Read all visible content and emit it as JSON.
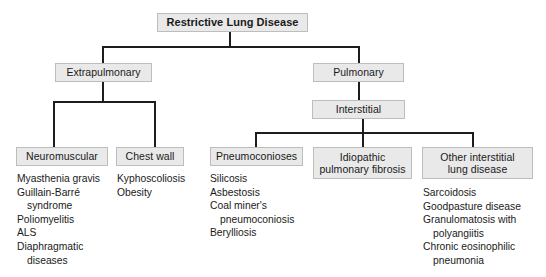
{
  "diagram": {
    "title": "Restrictive Lung Disease",
    "type": "hierarchy-flowchart",
    "nodes": {
      "root": "Restrictive Lung Disease",
      "extrapulmonary": "Extrapulmonary",
      "pulmonary": "Pulmonary",
      "interstitial": "Interstitial",
      "neuromuscular": "Neuromuscular",
      "chest_wall": "Chest wall",
      "pneumoconioses": "Pneumoconioses",
      "idiopathic_pulmonary_fibrosis_line1": "Idiopathic",
      "idiopathic_pulmonary_fibrosis_line2": "pulmonary fibrosis",
      "other_interstitial_line1": "Other interstitial",
      "other_interstitial_line2": "lung disease"
    },
    "lists": {
      "neuromuscular": {
        "items": [
          {
            "main": "Myasthenia gravis",
            "cont": ""
          },
          {
            "main": "Guillain-Barré",
            "cont": "syndrome"
          },
          {
            "main": "Poliomyelitis",
            "cont": ""
          },
          {
            "main": "ALS",
            "cont": ""
          },
          {
            "main": "Diaphragmatic",
            "cont": "diseases"
          }
        ]
      },
      "chest_wall": {
        "items": [
          {
            "main": "Kyphoscoliosis",
            "cont": ""
          },
          {
            "main": "Obesity",
            "cont": ""
          }
        ]
      },
      "pneumoconioses": {
        "items": [
          {
            "main": "Silicosis",
            "cont": ""
          },
          {
            "main": "Asbestosis",
            "cont": ""
          },
          {
            "main": "Coal miner's",
            "cont": "pneumoconiosis"
          },
          {
            "main": "Berylliosis",
            "cont": ""
          }
        ]
      },
      "idiopathic_pulmonary_fibrosis": {
        "items": []
      },
      "other_interstitial_lung_disease": {
        "items": [
          {
            "main": "Sarcoidosis",
            "cont": ""
          },
          {
            "main": "Goodpasture disease",
            "cont": ""
          },
          {
            "main": "Granulomatosis with",
            "cont": "polyangiitis"
          },
          {
            "main": "Chronic eosinophilic",
            "cont": "pneumonia"
          }
        ]
      }
    },
    "colors": {
      "box_fill": "#e9e9e9",
      "box_border": "#bdbdbd",
      "line": "#1d1d1d",
      "text": "#1a1a1a",
      "background": "#ffffff"
    }
  }
}
